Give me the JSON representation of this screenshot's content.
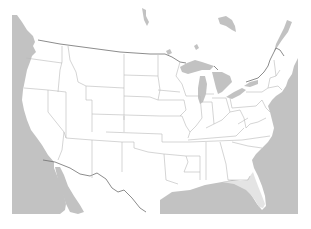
{
  "map": {
    "title": "United States blank outline map",
    "subject": "Contiguous United States with state borders",
    "labels": [],
    "colors": {
      "water": "#c2c2c2",
      "land": "#ffffff",
      "state_line": "#b9b9b9",
      "intl_line": "#6e6e6e",
      "highlight": "#e4e4e4"
    },
    "regions": {
      "water_bodies": [
        "Pacific Ocean",
        "Atlantic Ocean",
        "Gulf of Mexico",
        "Gulf of California",
        "Great Lakes",
        "Lake Winnipeg",
        "Hudson/James Bay area"
      ],
      "highlighted_state": "Florida"
    }
  }
}
